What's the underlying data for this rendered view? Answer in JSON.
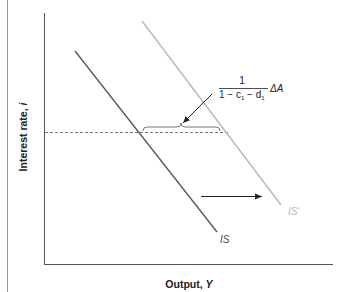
{
  "diagram": {
    "type": "IS curve shift",
    "axes": {
      "x_label": "Output, Y",
      "x_label_text": "Output, ",
      "x_label_var": "Y",
      "y_label_text": "Interest rate, ",
      "y_label_var": "i"
    },
    "curves": [
      {
        "name": "IS",
        "label": "IS",
        "color": "#555555"
      },
      {
        "name": "IS-prime",
        "label": "IS′",
        "color": "#b5b5b5"
      }
    ],
    "annotation": {
      "numerator": "1",
      "denominator_parts": [
        "1 − c",
        "1",
        " − d",
        "1"
      ],
      "multiplier": "ΔA",
      "description": "1/(1 - c1 - d1) ΔA"
    },
    "shift_arrow": {
      "direction": "right"
    },
    "colors": {
      "axis": "#555555",
      "is": "#555555",
      "is_prime": "#b5b5b5",
      "dashed": "#777777",
      "text": "#222222"
    }
  }
}
